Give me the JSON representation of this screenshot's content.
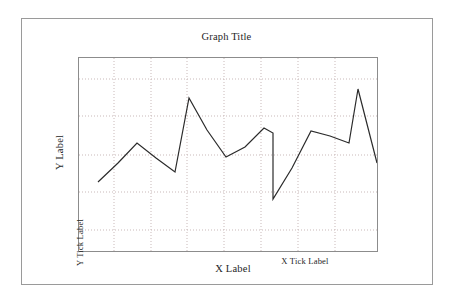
{
  "figure": {
    "background_color": "#ffffff",
    "frame_color": "#9a9a9a",
    "plot_border_color": "#8c8c8c"
  },
  "labels": {
    "title": "Graph Title",
    "y_label": "Y Label",
    "y_tick_label": "Y Tick Label",
    "x_label": "X Label",
    "x_tick_label": "X Tick Label"
  },
  "chart_data": {
    "type": "line",
    "title": "Graph Title",
    "xlabel": "X Label",
    "ylabel": "Y Label",
    "x_tick_label": "X Tick Label",
    "y_tick_label": "Y Tick Label",
    "grid": true,
    "grid_style": "dotted",
    "grid_color": "#c8b6b6",
    "legend": "none",
    "line_color": "#2b2b2b",
    "line_width": 1.2,
    "markers": "none",
    "xlim": [
      0,
      16
    ],
    "ylim": [
      0,
      10
    ],
    "x_gridlines": [
      2,
      4,
      6,
      8,
      10,
      12,
      14
    ],
    "y_gridlines": [
      2,
      4,
      6,
      8,
      9
    ],
    "x": [
      0,
      1,
      2,
      3,
      4,
      5,
      6,
      7,
      8,
      9,
      10,
      11,
      12,
      13,
      14,
      15,
      16
    ],
    "values": [
      3.05,
      4.05,
      5.05,
      4.25,
      3.55,
      7.75,
      6.1,
      4.75,
      5.25,
      6.2,
      5.9,
      2.6,
      4.6,
      6.6,
      6.35,
      5.95,
      8.3
    ],
    "series": [
      {
        "name": "series-1",
        "values": [
          3.05,
          4.05,
          5.05,
          4.25,
          3.55,
          7.75,
          6.1,
          4.75,
          5.25,
          6.2,
          5.9,
          2.6,
          4.6,
          6.6,
          6.35,
          5.95,
          8.3
        ]
      }
    ],
    "points_px": [
      [
        19,
        124
      ],
      [
        39,
        105
      ],
      [
        58,
        85
      ],
      [
        77,
        100
      ],
      [
        96,
        114
      ],
      [
        110,
        40
      ],
      [
        128,
        72
      ],
      [
        147,
        99
      ],
      [
        166,
        89
      ],
      [
        185,
        70
      ],
      [
        194,
        75
      ],
      [
        194,
        141
      ],
      [
        213,
        110
      ],
      [
        232,
        73
      ],
      [
        251,
        78
      ],
      [
        270,
        85
      ],
      [
        279,
        31
      ],
      [
        298,
        105
      ]
    ]
  }
}
